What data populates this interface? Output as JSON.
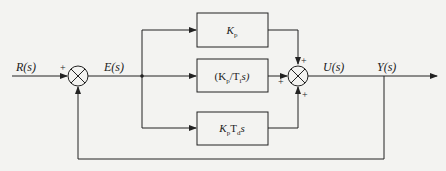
{
  "diagram": {
    "type": "block-diagram",
    "signals": {
      "input": "R(s)",
      "error": "E(s)",
      "control": "U(s)",
      "output": "Y(s)"
    },
    "blocks": [
      {
        "id": "proportional",
        "label_main": "K",
        "label_sub": "p"
      },
      {
        "id": "integral",
        "label_pre": "(K",
        "label_sub1": "p",
        "label_mid": "/T",
        "label_sub2": "i",
        "label_post": "s)"
      },
      {
        "id": "derivative",
        "label_main": "K",
        "label_sub1": "p",
        "label_mid": "T",
        "label_sub2": "d",
        "label_post": "s"
      }
    ],
    "summing_junctions": [
      {
        "id": "error-sum",
        "signs": [
          "+",
          "-"
        ],
        "visible_signs": [
          "+"
        ]
      },
      {
        "id": "output-sum",
        "signs": [
          "+",
          "+",
          "+"
        ]
      }
    ],
    "sign_plus": "+"
  },
  "colors": {
    "background": "#f3f3f1",
    "line": "#222222"
  }
}
